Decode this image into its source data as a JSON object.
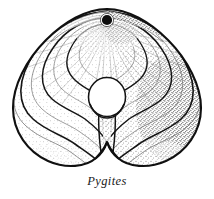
{
  "figure": {
    "caption": "Pygites",
    "view": "dorsal-valve-exterior",
    "width": 214,
    "height": 199,
    "background_color": "#ffffff",
    "ink_color": "#111111",
    "line_color_primary": "#141414",
    "line_color_secondary": "#7a7a7a",
    "stipple_color": "#3a3a3a",
    "caption_color": "#1a1a1a"
  },
  "anatomy": {
    "outline": {
      "name": "shell-outline",
      "shape": "cordate-triangular",
      "apex_point": [
        107,
        9
      ],
      "left_extent": 13,
      "right_extent": 201,
      "bottom_extent": 166
    },
    "foramen": {
      "name": "foramen",
      "center": [
        107,
        20
      ],
      "radius": 5.2,
      "fill": "#0d0d0d"
    },
    "perforation": {
      "name": "central-perforation",
      "center": [
        107,
        97
      ],
      "radius_x": 18,
      "radius_y": 19,
      "fill": "#ffffff"
    },
    "median_stem": {
      "name": "median-septum-stem",
      "top": [
        107,
        116
      ],
      "bottom": [
        107,
        166
      ]
    },
    "growth_lines": {
      "name": "concentric-growth-lines",
      "count": 9,
      "scales": [
        0.2,
        0.3,
        0.4,
        0.5,
        0.6,
        0.7,
        0.8,
        0.9,
        1.0
      ],
      "weights": [
        "thin",
        "thick",
        "thin",
        "thick",
        "thin",
        "thick",
        "thin",
        "thick",
        "thick"
      ]
    },
    "radial_lines": {
      "name": "radial-striae",
      "count": 17,
      "origin": [
        107,
        22
      ]
    },
    "shading": {
      "name": "stipple-shading",
      "light_direction": "upper-left",
      "dense_side": "right"
    }
  }
}
